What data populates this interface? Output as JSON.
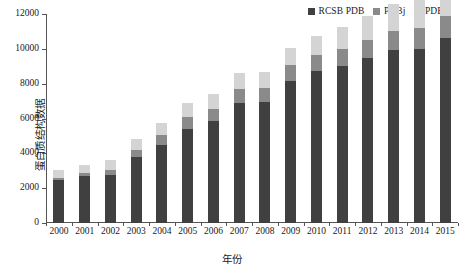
{
  "chart_data": {
    "type": "bar",
    "stacked": true,
    "title": "",
    "xlabel": "年份",
    "ylabel": "蛋白质结构数据",
    "ylim": [
      0,
      12000
    ],
    "yticks": [
      0,
      2000,
      4000,
      6000,
      8000,
      10000,
      12000
    ],
    "ytick_labels": [
      "0",
      "2000",
      "4000",
      "6000",
      "8000",
      "10000",
      "12000"
    ],
    "grid": false,
    "legend_position": "top-right",
    "categories": [
      "2000",
      "2001",
      "2002",
      "2003",
      "2004",
      "2005",
      "2006",
      "2007",
      "2008",
      "2009",
      "2010",
      "2011",
      "2012",
      "2013",
      "2014",
      "2015"
    ],
    "series": [
      {
        "name": "RCSB PDB",
        "color": "#404040",
        "values": [
          2450,
          2700,
          2750,
          3800,
          4500,
          5400,
          5850,
          6900,
          6950,
          8150,
          8700,
          9000,
          9450,
          9950,
          10000,
          10650
        ]
      },
      {
        "name": "PDBj",
        "color": "#8a8a8a",
        "values": [
          150,
          160,
          300,
          420,
          560,
          700,
          700,
          800,
          800,
          900,
          950,
          1000,
          1050,
          1100,
          1200,
          1250
        ]
      },
      {
        "name": "PDBe",
        "color": "#d4d4d4",
        "values": [
          450,
          500,
          550,
          600,
          700,
          800,
          850,
          900,
          900,
          1000,
          1100,
          1250,
          1400,
          1500,
          1600,
          1700
        ]
      }
    ],
    "totals": [
      3050,
      3360,
      3600,
      4820,
      5760,
      6900,
      7400,
      8600,
      8650,
      10050,
      10750,
      11250,
      11900,
      12550,
      12800,
      13600
    ]
  },
  "legend": {
    "entries": [
      {
        "label": "RCSB PDB",
        "color": "#404040"
      },
      {
        "label": "PDBj",
        "color": "#8a8a8a"
      },
      {
        "label": "PDBe",
        "color": "#d4d4d4"
      }
    ]
  },
  "axes": {
    "y_title": "蛋白质结构数据",
    "x_title": "年份"
  }
}
